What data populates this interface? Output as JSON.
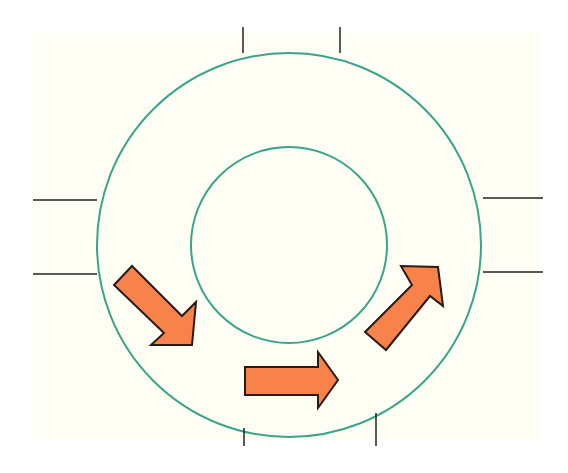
{
  "diagram": {
    "type": "roundabout-traffic-flow",
    "colors": {
      "background": "#fffef5",
      "ring_stroke": "#3aa58a",
      "road_edge": "#222222",
      "arrow_fill": "#f7834a",
      "arrow_stroke": "#2a1a10"
    },
    "rings": [
      {
        "name": "outer-circle",
        "cx": 289,
        "cy": 245,
        "r": 192
      },
      {
        "name": "inner-circle",
        "cx": 289,
        "cy": 245,
        "r": 98
      }
    ],
    "road_entries": [
      {
        "name": "north-road",
        "lines": [
          [
            243,
            27,
            243,
            53
          ],
          [
            340,
            27,
            340,
            53
          ]
        ]
      },
      {
        "name": "west-road",
        "lines": [
          [
            33,
            200,
            97,
            200
          ],
          [
            33,
            274,
            97,
            274
          ]
        ]
      },
      {
        "name": "east-road",
        "lines": [
          [
            483,
            198,
            543,
            198
          ],
          [
            483,
            272,
            543,
            272
          ]
        ]
      },
      {
        "name": "south-road",
        "lines": [
          [
            244,
            428,
            244,
            446
          ],
          [
            376,
            413,
            376,
            446
          ]
        ]
      }
    ],
    "arrows": [
      {
        "name": "arrow-southeast",
        "direction": "down-right",
        "points": "114,285 132,266 182,316 196,302 192,345 151,345 164,333"
      },
      {
        "name": "arrow-east",
        "direction": "right",
        "points": "245,367 318,367 318,352 338,380 318,408 318,395 245,395"
      },
      {
        "name": "arrow-northeast",
        "direction": "up-right",
        "points": "365,332 412,285 401,266 438,267 443,306 430,296 386,350"
      }
    ]
  }
}
